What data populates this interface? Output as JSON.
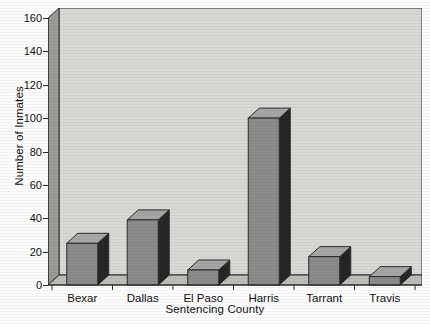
{
  "chart_data": {
    "type": "bar",
    "title": "",
    "xlabel": "Sentencing County",
    "ylabel": "Number of Inmates",
    "categories": [
      "Bexar",
      "Dallas",
      "El Paso",
      "Harris",
      "Tarrant",
      "Travis"
    ],
    "values": [
      25,
      39,
      9,
      100,
      17,
      5
    ],
    "ylim": [
      0,
      160
    ],
    "yticks": [
      0,
      20,
      40,
      60,
      80,
      100,
      120,
      140,
      160
    ],
    "ytick_labels": [
      "0",
      "20",
      "40",
      "60",
      "80",
      "100",
      "120",
      "140",
      "160"
    ],
    "grid": false,
    "legend": null,
    "style": "3d-bar-grayscale",
    "colors": {
      "bar_front": "#8b8b8b",
      "bar_top": "#a6a6a6",
      "bar_side": "#262626",
      "plot_back_wall": "#d8d8d4",
      "plot_left_wall": "#9a9a96",
      "plot_floor": "#bdbdb8",
      "axis_line": "#2b2b2b",
      "text": "#111111",
      "background": "#fdfdfd"
    }
  }
}
